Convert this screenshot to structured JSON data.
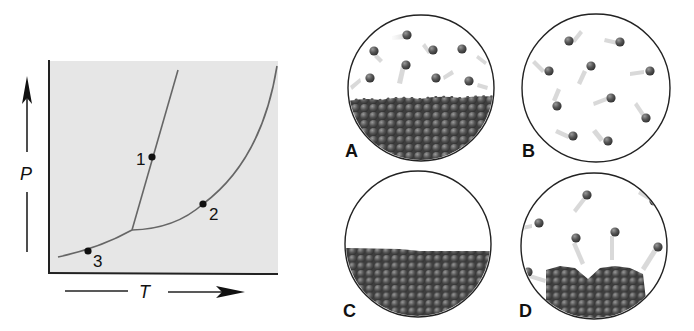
{
  "phase_diagram": {
    "x_axis_label": "T",
    "y_axis_label": "P",
    "background": "#e6e6e6",
    "curve_color": "#6a6a6a",
    "points": [
      {
        "label": "1",
        "x": 152,
        "y": 157
      },
      {
        "label": "2",
        "x": 203,
        "y": 204
      },
      {
        "label": "3",
        "x": 88,
        "y": 251
      }
    ],
    "triple_point": {
      "x": 132,
      "y": 230
    }
  },
  "panels": [
    {
      "label": "A",
      "description": "liquid with vapor above",
      "cx": 421,
      "cy": 88,
      "r": 73,
      "surface_y": 100
    },
    {
      "label": "B",
      "description": "gas only",
      "cx": 596,
      "cy": 88,
      "r": 74
    },
    {
      "label": "C",
      "description": "liquid only, no vapor",
      "cx": 418,
      "cy": 244,
      "r": 73,
      "surface_y": 249
    },
    {
      "label": "D",
      "description": "solid with vapor above",
      "cx": 594,
      "cy": 246,
      "r": 73
    }
  ],
  "colors": {
    "particle": "#4a4a4a",
    "particle_highlight": "#8a8a8a",
    "trail": "#cfcfcf",
    "outline": "#222222"
  }
}
